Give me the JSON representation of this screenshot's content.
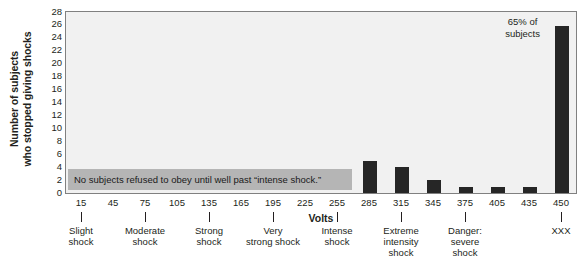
{
  "chart_data": {
    "type": "bar",
    "title": "",
    "xlabel": "Volts",
    "ylabel_line1": "Number of subjects",
    "ylabel_line2": "who stopped giving shocks",
    "categories": [
      "15",
      "45",
      "75",
      "105",
      "135",
      "165",
      "195",
      "225",
      "255",
      "285",
      "315",
      "345",
      "375",
      "405",
      "435",
      "450"
    ],
    "values": [
      0,
      0,
      0,
      0,
      0,
      0,
      0,
      0,
      0,
      5,
      4,
      2,
      1,
      1,
      1,
      26
    ],
    "ylim": [
      0,
      28
    ],
    "ytick_values": [
      "28",
      "26",
      "24",
      "22",
      "20",
      "18",
      "16",
      "14",
      "12",
      "10",
      "8",
      "6",
      "4",
      "2",
      "0"
    ],
    "grid": false,
    "legend": "none",
    "annotations": [
      {
        "name": "no-subjects-band",
        "text": "No subjects refused to obey until well past “intense shock.”"
      },
      {
        "name": "percent-callout",
        "line1": "65% of",
        "line2": "subjects"
      }
    ],
    "category_groups": [
      {
        "label_line1": "Slight",
        "label_line2": "shock",
        "label_line3": "",
        "tick_at": "15"
      },
      {
        "label_line1": "Moderate",
        "label_line2": "shock",
        "label_line3": "",
        "tick_at": "75"
      },
      {
        "label_line1": "Strong",
        "label_line2": "shock",
        "label_line3": "",
        "tick_at": "135"
      },
      {
        "label_line1": "Very",
        "label_line2": "strong shock",
        "label_line3": "",
        "tick_at": "195"
      },
      {
        "label_line1": "Intense",
        "label_line2": "shock",
        "label_line3": "",
        "tick_at": "255"
      },
      {
        "label_line1": "Extreme",
        "label_line2": "intensity",
        "label_line3": "shock",
        "tick_at": "315"
      },
      {
        "label_line1": "Danger:",
        "label_line2": "severe",
        "label_line3": "shock",
        "tick_at": "375"
      },
      {
        "label_line1": "XXX",
        "label_line2": "",
        "label_line3": "",
        "tick_at": "450"
      }
    ],
    "colors": {
      "bar": "#262626",
      "plot_background": "#f1f1f1",
      "annotation_band": "#b5b5b5",
      "axis": "#808080",
      "text": "#231f20"
    }
  }
}
